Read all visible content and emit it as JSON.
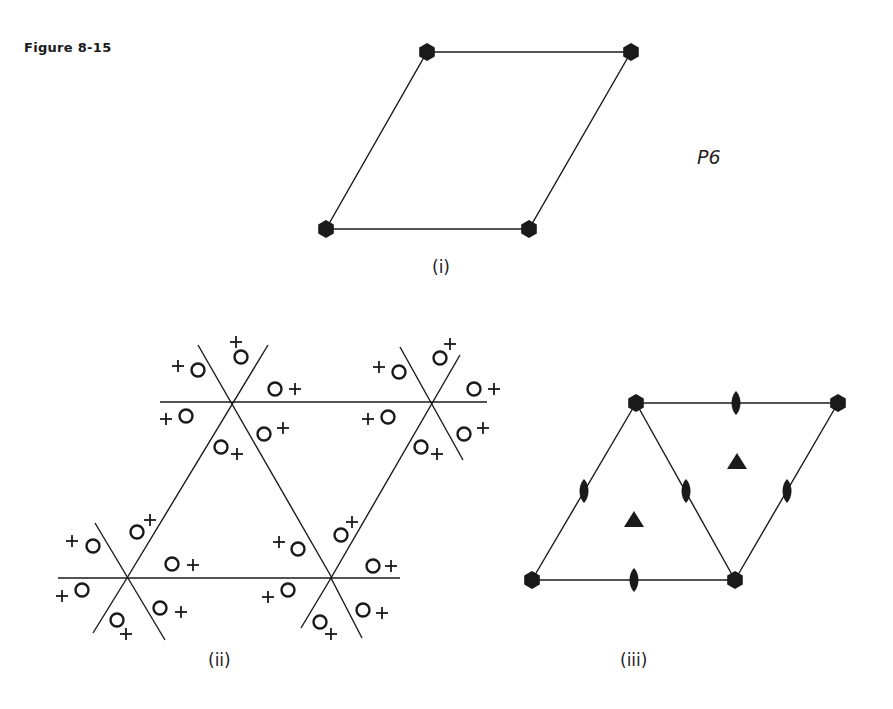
{
  "figure": {
    "title": "Figure 8-15",
    "plane_group_symbol": "P6",
    "panels": [
      {
        "id": "i",
        "label": "(i)",
        "description": "Unit cell with sixfold rotation axes at corners"
      },
      {
        "id": "ii",
        "label": "(ii)",
        "description": "Motif pattern of circles with + signs arranged around sixfold axes"
      },
      {
        "id": "iii",
        "label": "(iii)",
        "description": "Symmetry elements: sixfold (hexagons), threefold (triangles), twofold (lenses) axes"
      }
    ],
    "colors": {
      "ink": "#1a1a1a",
      "background": "#ffffff"
    }
  }
}
